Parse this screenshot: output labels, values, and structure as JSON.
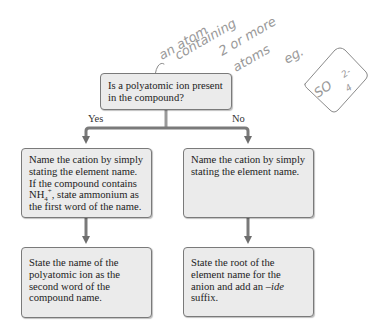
{
  "diagram": {
    "question": {
      "line1": "Is a polyatomic ion present",
      "line2": "in the compound?"
    },
    "branches": {
      "yes_label": "Yes",
      "no_label": "No"
    },
    "yes_step1": {
      "line1": "Name the cation by simply",
      "line2": "stating the element name.",
      "line3": "If the compound contains",
      "line4_prefix": "NH",
      "line4_sub": "4",
      "line4_sup": "+",
      "line4_suffix": ", state ammonium as",
      "line5": "the first word of the name."
    },
    "no_step1": {
      "line1": "Name the cation by simply",
      "line2": "stating the element name."
    },
    "yes_step2": {
      "line1": "State the name of the",
      "line2": "polyatomic ion as the",
      "line3": "second word of the",
      "line4": "compound name."
    },
    "no_step2": {
      "line1": "State the root of the",
      "line2": "element name for the",
      "line3_prefix": "anion and add an ",
      "line3_italic": "–ide",
      "line4": "suffix."
    },
    "colors": {
      "box_fill": "#ebebeb",
      "box_border": "#7a7a7a",
      "arrow": "#707070",
      "handwriting": "#999999"
    }
  },
  "handwritten_note": {
    "line1": "an atom",
    "line2": "containing",
    "line3": "2 or more",
    "line4": "atoms",
    "line5": "eg.",
    "example_formula": "SO",
    "example_sub": "4",
    "example_sup": "2-"
  }
}
